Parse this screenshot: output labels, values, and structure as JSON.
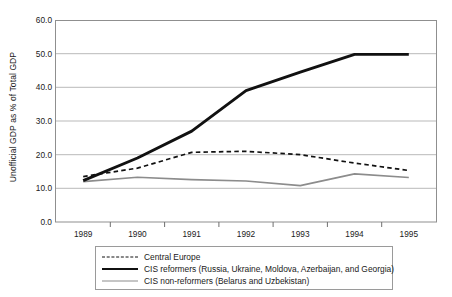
{
  "chart_data": {
    "type": "line",
    "title": "",
    "xlabel": "",
    "ylabel": "Unofficial GDP as % of Total GDP",
    "categories": [
      "1989",
      "1990",
      "1991",
      "1992",
      "1993",
      "1994",
      "1995"
    ],
    "ylim": [
      0.0,
      60.0
    ],
    "ytick_labels": [
      "0.0",
      "10.0",
      "20.0",
      "30.0",
      "40.0",
      "50.0",
      "60.0"
    ],
    "ytick_values": [
      0.0,
      10.0,
      20.0,
      30.0,
      40.0,
      50.0,
      60.0
    ],
    "grid": true,
    "legend_position": "bottom",
    "series": [
      {
        "name": "Central Europe",
        "style": "dashed",
        "color": "#111111",
        "width": 1.4,
        "values": [
          13.5,
          16.0,
          20.7,
          21.0,
          20.0,
          17.5,
          15.3
        ]
      },
      {
        "name": "CIS reformers (Russia, Ukraine, Moldova, Azerbaijan, and Georgia)",
        "style": "solid",
        "color": "#111111",
        "width": 2.6,
        "values": [
          12.3,
          19.0,
          27.0,
          39.0,
          44.5,
          49.8,
          49.8
        ]
      },
      {
        "name": "CIS non-reformers (Belarus and Uzbekistan)",
        "style": "solid",
        "color": "#8c8c8c",
        "width": 1.4,
        "values": [
          12.0,
          13.3,
          12.6,
          12.2,
          10.8,
          14.3,
          13.2
        ]
      }
    ]
  },
  "axes": {
    "y_title": "Unofficial GDP as % of Total GDP"
  },
  "legend": {
    "entries": [
      {
        "label": "Central Europe",
        "swatch": "dashed-black-line-icon"
      },
      {
        "label": "CIS reformers (Russia, Ukraine, Moldova, Azerbaijan, and Georgia)",
        "swatch": "thick-black-line-icon"
      },
      {
        "label": "CIS non-reformers (Belarus and Uzbekistan)",
        "swatch": "thin-gray-line-icon"
      }
    ]
  },
  "colors": {
    "plot_border": "#8f8f8f",
    "gridline": "#b9b9b9",
    "series_dark": "#111111",
    "series_gray": "#8c8c8c",
    "background": "#ffffff"
  }
}
